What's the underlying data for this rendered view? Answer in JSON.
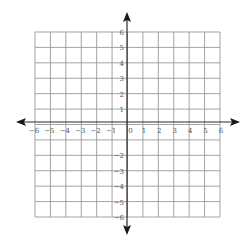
{
  "chart_data": {
    "type": "coordinate-grid",
    "title": "",
    "xlabel": "",
    "ylabel": "",
    "xlim": [
      -6,
      6
    ],
    "ylim": [
      -6,
      6
    ],
    "grid": true,
    "x_ticks": [
      "−6",
      "−5",
      "−4",
      "−3",
      "−2",
      "−1",
      "0",
      "1",
      "2",
      "3",
      "4",
      "5",
      "6"
    ],
    "y_ticks_positive": [
      "6",
      "5",
      "4",
      "3",
      "2",
      "1"
    ],
    "y_ticks_negative": [
      "−2",
      "−3",
      "−4",
      "−5",
      "−6"
    ],
    "axis_arrows": [
      "left",
      "right",
      "up",
      "down"
    ],
    "colors": {
      "grid": "#9a9a9a",
      "axis": "#2a2a2a",
      "labels": "#555555"
    }
  }
}
